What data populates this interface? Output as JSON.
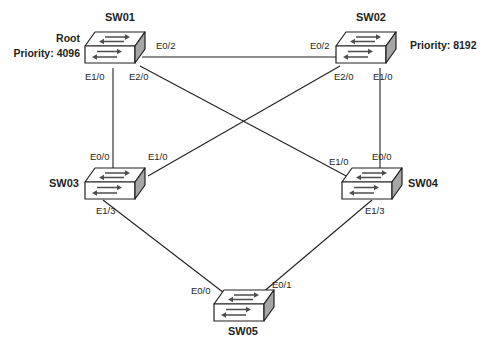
{
  "diagram": {
    "background_color": "#ffffff",
    "line_color": "#231f20",
    "switch_side_fill": "#a6a6a6",
    "arrow_color": "#4d4d4d"
  },
  "devices": [
    {
      "id": "sw01",
      "name": "SW01",
      "role_label": "Root",
      "priority_label": "Priority: 4096",
      "priority_value": 4096
    },
    {
      "id": "sw02",
      "name": "SW02",
      "role_label": "",
      "priority_label": "Priority: 8192",
      "priority_value": 8192
    },
    {
      "id": "sw03",
      "name": "SW03",
      "role_label": "",
      "priority_label": "",
      "priority_value": null
    },
    {
      "id": "sw04",
      "name": "SW04",
      "role_label": "",
      "priority_label": "",
      "priority_value": null
    },
    {
      "id": "sw05",
      "name": "SW05",
      "role_label": "",
      "priority_label": "",
      "priority_value": null
    }
  ],
  "ports": {
    "sw01_e02": "E0/2",
    "sw01_e10": "E1/0",
    "sw01_e20": "E2/0",
    "sw02_e02": "E0/2",
    "sw02_e20": "E2/0",
    "sw02_e10": "E1/0",
    "sw03_e00": "E0/0",
    "sw03_e10": "E1/0",
    "sw03_e13": "E1/3",
    "sw04_e10": "E1/0",
    "sw04_e00": "E0/0",
    "sw04_e13": "E1/3",
    "sw05_e00": "E0/0",
    "sw05_e01": "E0/1"
  },
  "links": [
    {
      "id": "sw01-sw02",
      "from": "SW01 E0/2",
      "to": "SW02 E0/2"
    },
    {
      "id": "sw01-sw03",
      "from": "SW01 E1/0",
      "to": "SW03 E0/0"
    },
    {
      "id": "sw01-sw04",
      "from": "SW01 E2/0",
      "to": "SW04 E1/0"
    },
    {
      "id": "sw02-sw03",
      "from": "SW02 E2/0",
      "to": "SW03 E1/0"
    },
    {
      "id": "sw02-sw04",
      "from": "SW02 E1/0",
      "to": "SW04 E0/0"
    },
    {
      "id": "sw03-sw05",
      "from": "SW03 E1/3",
      "to": "SW05 E0/0"
    },
    {
      "id": "sw04-sw05",
      "from": "SW04 E1/3",
      "to": "SW05 E0/1"
    }
  ],
  "watermark": ""
}
